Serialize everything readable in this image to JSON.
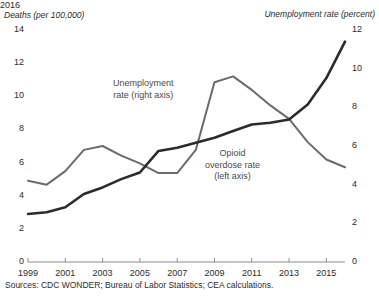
{
  "chart_data": {
    "type": "line",
    "title": "",
    "xlabel": "",
    "ylabel": "Deaths (per 100,000)",
    "y2label": "Unemployment rate (percent)",
    "x": [
      1999,
      2000,
      2001,
      2002,
      2003,
      2004,
      2005,
      2006,
      2007,
      2008,
      2009,
      2010,
      2011,
      2012,
      2013,
      2014,
      2015,
      2016
    ],
    "xlim": [
      1999,
      2016
    ],
    "xticks": [
      "1999",
      "2001",
      "2003",
      "2005",
      "2007",
      "2009",
      "2011",
      "2013",
      "2015"
    ],
    "xtick_values": [
      1999,
      2001,
      2003,
      2005,
      2007,
      2009,
      2011,
      2013,
      2015
    ],
    "ylim": [
      0,
      14
    ],
    "yticks": [
      "0",
      "2",
      "4",
      "6",
      "8",
      "10",
      "12",
      "14"
    ],
    "ytick_values": [
      0,
      2,
      4,
      6,
      8,
      10,
      12,
      14
    ],
    "y2lim": [
      0,
      12
    ],
    "y2ticks": [
      "0",
      "2",
      "4",
      "6",
      "8",
      "10",
      "12"
    ],
    "y2tick_values": [
      0,
      2,
      4,
      6,
      8,
      10,
      12
    ],
    "grid": false,
    "legend": "inline-annotations",
    "series": [
      {
        "name": "Opioid overdose rate (left axis)",
        "axis": "left",
        "color": "#2b2b2b",
        "width": 2.6,
        "values": [
          2.9,
          3.0,
          3.3,
          4.1,
          4.5,
          5.0,
          5.4,
          6.7,
          6.9,
          7.2,
          7.5,
          7.9,
          8.3,
          8.4,
          8.6,
          9.5,
          11.1,
          13.3
        ]
      },
      {
        "name": "Unemployment rate (right axis)",
        "axis": "right",
        "color": "#6b6b6b",
        "width": 2.0,
        "values": [
          4.2,
          4.0,
          4.7,
          5.8,
          6.0,
          5.5,
          5.1,
          4.6,
          4.6,
          5.8,
          9.3,
          9.6,
          8.9,
          8.1,
          7.4,
          6.2,
          5.3,
          4.9
        ]
      }
    ],
    "annotations": [
      {
        "name": "unemployment-label",
        "text_lines": [
          "Unemployment",
          "rate (right axis)"
        ]
      },
      {
        "name": "opioid-label",
        "text_lines": [
          "Opioid",
          "overdose rate",
          "(left axis)"
        ]
      },
      {
        "name": "endpoint-year",
        "text": "2016"
      }
    ]
  },
  "header": {
    "cut_title": "",
    "left_axis_title": "Deaths (per 100,000)",
    "right_axis_title": "Unemployment rate (percent)"
  },
  "annotations": {
    "unemployment_line1": "Unemployment",
    "unemployment_line2": "rate (right axis)",
    "opioid_line1": "Opioid",
    "opioid_line2": "overdose rate",
    "opioid_line3": "(left axis)",
    "endpoint_year": "2016"
  },
  "footer": {
    "source": "Sources: CDC WONDER; Bureau of Labor Statistics; CEA calculations."
  },
  "colors": {
    "opioid_line": "#2b2b2b",
    "unemployment_line": "#6b6b6b",
    "axis": "#8c8c8c",
    "text": "#2b2b2b"
  }
}
